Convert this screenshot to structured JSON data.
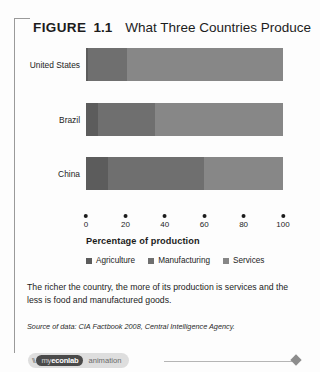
{
  "figure": {
    "label": "FIGURE",
    "number": "1.1",
    "title": "What Three Countries Produce"
  },
  "chart_data": {
    "type": "bar",
    "orientation": "horizontal",
    "stacked": true,
    "title": "What Three Countries Produce",
    "xlabel": "Percentage of production",
    "ylabel": "",
    "xlim": [
      0,
      100
    ],
    "xticks": [
      0,
      20,
      40,
      60,
      80,
      100
    ],
    "grid": false,
    "legend_position": "bottom",
    "categories": [
      "United States",
      "Brazil",
      "China"
    ],
    "series": [
      {
        "name": "Agriculture",
        "color": "#5c5c5c",
        "values": [
          1,
          6,
          11
        ]
      },
      {
        "name": "Manufacturing",
        "color": "#6f6f6f",
        "values": [
          20,
          29,
          49
        ]
      },
      {
        "name": "Services",
        "color": "#878787",
        "values": [
          79,
          65,
          40
        ]
      }
    ],
    "rows": [
      {
        "label": "United States",
        "segments": [
          {
            "name": "Agriculture",
            "start": 0,
            "end": 1,
            "value": 1
          },
          {
            "name": "Manufacturing",
            "start": 1,
            "end": 21,
            "value": 20
          },
          {
            "name": "Services",
            "start": 21,
            "end": 100,
            "value": 79
          }
        ]
      },
      {
        "label": "Brazil",
        "segments": [
          {
            "name": "Agriculture",
            "start": 0,
            "end": 6,
            "value": 6
          },
          {
            "name": "Manufacturing",
            "start": 6,
            "end": 35,
            "value": 29
          },
          {
            "name": "Services",
            "start": 35,
            "end": 100,
            "value": 65
          }
        ]
      },
      {
        "label": "China",
        "segments": [
          {
            "name": "Agriculture",
            "start": 0,
            "end": 11,
            "value": 11
          },
          {
            "name": "Manufacturing",
            "start": 11,
            "end": 60,
            "value": 49
          },
          {
            "name": "Services",
            "start": 60,
            "end": 100,
            "value": 40
          }
        ]
      }
    ]
  },
  "axis": {
    "title": "Percentage of production",
    "ticks": [
      "0",
      "20",
      "40",
      "60",
      "80",
      "100"
    ]
  },
  "legend": [
    {
      "label": "Agriculture",
      "color": "#5c5c5c"
    },
    {
      "label": "Manufacturing",
      "color": "#6f6f6f"
    },
    {
      "label": "Services",
      "color": "#878787"
    }
  ],
  "caption": "The richer the country, the more of its production is services and the less is food and manufactured goods.",
  "source": "Source of data: CIA Factbook 2008, Central Intelligence Agency.",
  "footer": {
    "logo_mark": "\\\\",
    "logo_my": "my",
    "logo_econlab": "econlab",
    "animation_label": "animation"
  }
}
